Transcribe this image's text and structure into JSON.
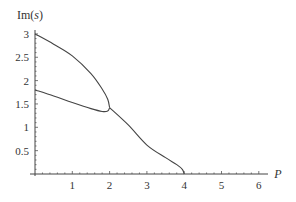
{
  "chart_data": {
    "type": "line",
    "title": "",
    "xlabel": "P",
    "ylabel": "Im(s)",
    "xlim": [
      0,
      6.25
    ],
    "ylim": [
      0,
      3.05
    ],
    "grid": false,
    "legend": null,
    "x_ticks": [
      1,
      2,
      3,
      4,
      5,
      6
    ],
    "x_tick_labels": [
      "1",
      "2",
      "3",
      "4",
      "5",
      "6"
    ],
    "y_ticks": [
      0.5,
      1,
      1.5,
      2,
      2.5,
      3
    ],
    "y_tick_labels": [
      "0.5",
      "1",
      "1.5",
      "2",
      "2.5",
      "3"
    ],
    "series": [
      {
        "name": "upper branch",
        "x": [
          0,
          0.5,
          1.0,
          1.5,
          1.8,
          1.95,
          2.0
        ],
        "y": [
          3.0,
          2.78,
          2.53,
          2.15,
          1.82,
          1.6,
          1.42
        ]
      },
      {
        "name": "lower branch",
        "x": [
          0,
          0.5,
          1.0,
          1.5,
          1.8,
          1.95,
          2.0
        ],
        "y": [
          1.8,
          1.67,
          1.53,
          1.4,
          1.34,
          1.35,
          1.42
        ]
      },
      {
        "name": "merged branch",
        "x": [
          2.0,
          2.5,
          3.0,
          3.5,
          3.8,
          3.95,
          4.0
        ],
        "y": [
          1.42,
          1.05,
          0.62,
          0.35,
          0.2,
          0.1,
          0.0
        ]
      }
    ]
  }
}
